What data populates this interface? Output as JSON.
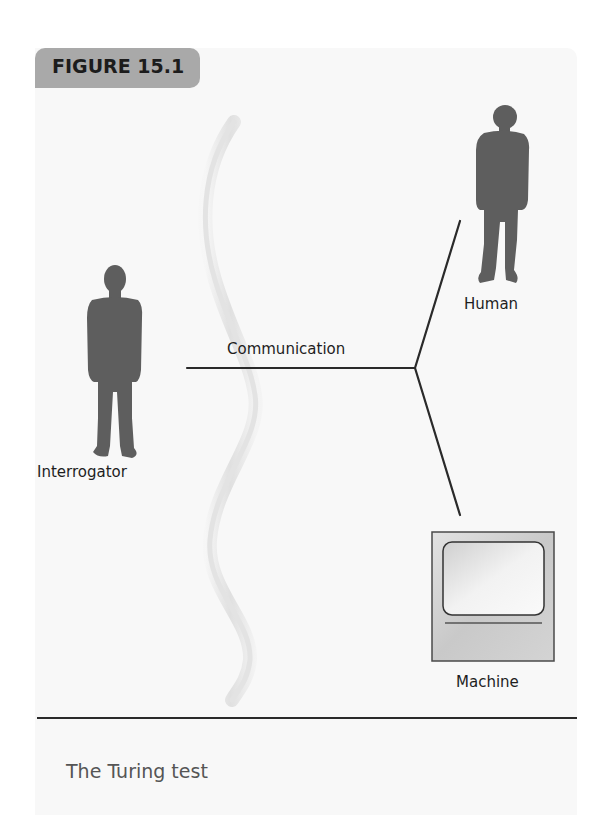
{
  "figure": {
    "number_label": "FIGURE 15.1",
    "caption": "The Turing test"
  },
  "diagram": {
    "connector_label": "Communication",
    "nodes": [
      {
        "id": "interrogator",
        "label": "Interrogator",
        "icon": "person-silhouette-icon"
      },
      {
        "id": "human",
        "label": "Human",
        "icon": "person-silhouette-icon"
      },
      {
        "id": "machine",
        "label": "Machine",
        "icon": "computer-monitor-icon"
      }
    ],
    "edges": [
      {
        "from": "interrogator",
        "to": "junction",
        "label": "Communication"
      },
      {
        "from": "junction",
        "to": "human"
      },
      {
        "from": "junction",
        "to": "machine"
      }
    ],
    "barrier": "wavy-wall-separator"
  },
  "colors": {
    "tab_background": "#a9a9a9",
    "panel_background": "#f8f8f8",
    "silhouette": "#5e5e5e",
    "line": "#2a2a2a",
    "caption_text": "#555555"
  }
}
